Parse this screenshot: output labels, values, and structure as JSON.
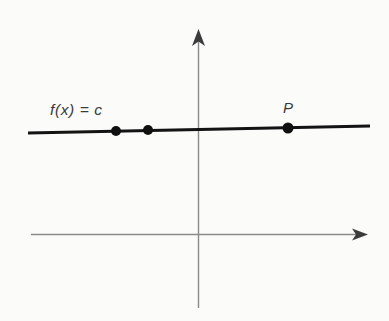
{
  "figure": {
    "background_color": "#fbfbfa",
    "axis_color": "#8a8a8a",
    "curve_color": "#131313",
    "point_color": "#101010",
    "label_color": "#3a3a3a",
    "labels": {
      "function_label": "f(x) = c",
      "point_label": "P"
    }
  },
  "chart_data": {
    "type": "line",
    "title": "",
    "xlabel": "",
    "ylabel": "",
    "grid": false,
    "legend": "none",
    "axes": {
      "x_axis": {
        "x_start_px": 31,
        "x_end_px": 367,
        "y_px": 234,
        "arrow": "right",
        "tick_labels": []
      },
      "y_axis": {
        "y_start_px": 30,
        "y_end_px": 308,
        "x_px": 198,
        "arrow": "up",
        "tick_labels": []
      },
      "origin_px": [
        198,
        234
      ]
    },
    "series": [
      {
        "name": "f(x) = c",
        "kind": "line",
        "equation": "f(x) = c",
        "constant_value_px_y": 129,
        "x": [
          28,
          370
        ],
        "y_px": [
          133,
          126
        ],
        "stroke_width": 3.2
      }
    ],
    "points": [
      {
        "label": "",
        "x_px": 116,
        "y_px": 131,
        "radius_px": 5
      },
      {
        "label": "",
        "x_px": 148,
        "y_px": 130,
        "radius_px": 5
      },
      {
        "label": "P",
        "x_px": 288,
        "y_px": 128,
        "radius_px": 5.5
      }
    ],
    "annotations": [
      {
        "text": "f(x) = c",
        "x_px": 50,
        "y_px": 115,
        "anchor": "start",
        "style": "italic"
      },
      {
        "text": "P",
        "x_px": 288,
        "y_px": 113,
        "anchor": "middle",
        "style": "italic"
      }
    ]
  }
}
